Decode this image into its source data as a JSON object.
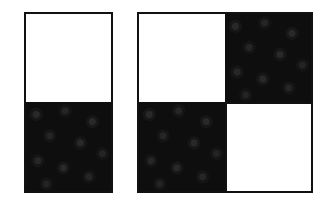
{
  "figure": {
    "background": "#ffffff",
    "border_color": "#111111",
    "dark_fill": "#0e0e0e",
    "light_fill": "#ffffff",
    "texture": "dark cells show faint gray circular blob texture",
    "panels": [
      {
        "id": "left",
        "layout": "2 rows x 1 column",
        "cells": [
          {
            "row": 0,
            "col": 0,
            "fill": "white"
          },
          {
            "row": 1,
            "col": 0,
            "fill": "dark"
          }
        ]
      },
      {
        "id": "right",
        "layout": "2 rows x 2 columns (checkerboard)",
        "cells": [
          {
            "row": 0,
            "col": 0,
            "fill": "white"
          },
          {
            "row": 0,
            "col": 1,
            "fill": "dark"
          },
          {
            "row": 1,
            "col": 0,
            "fill": "dark"
          },
          {
            "row": 1,
            "col": 1,
            "fill": "white"
          }
        ]
      }
    ]
  }
}
